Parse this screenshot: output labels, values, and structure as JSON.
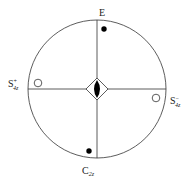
{
  "diagram": {
    "labels": {
      "top": {
        "main": "E",
        "sup": "",
        "sub": ""
      },
      "left": {
        "main": "S",
        "sup": "+",
        "sub": "4z"
      },
      "right": {
        "main": "S",
        "sup": "−",
        "sub": "4z"
      },
      "bottom": {
        "main": "C",
        "sup": "",
        "sub": "2z"
      }
    },
    "markers": [
      {
        "name": "E",
        "type": "filled-dot",
        "hemisphere": "upper"
      },
      {
        "name": "S4z+",
        "type": "open-circle",
        "hemisphere": "lower"
      },
      {
        "name": "S4z-",
        "type": "open-circle",
        "hemisphere": "lower"
      },
      {
        "name": "C2z",
        "type": "filled-dot",
        "hemisphere": "upper"
      }
    ],
    "center_symbol": "S4 axis (diamond with filled lens)",
    "colors": {
      "line": "#333333",
      "fill": "#000000",
      "background": "#ffffff"
    }
  }
}
